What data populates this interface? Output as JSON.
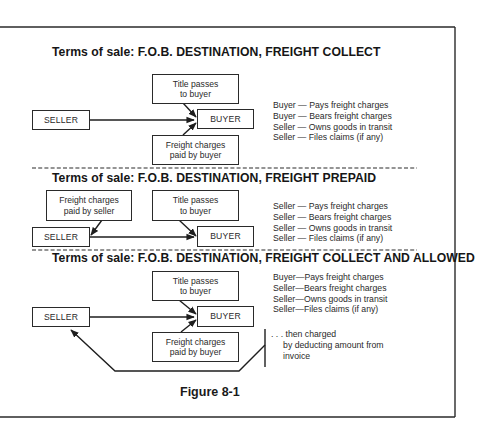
{
  "figure": {
    "caption": "Figure 8-1",
    "sections": [
      {
        "title": "Terms of sale: F.O.B. DESTINATION, FREIGHT COLLECT",
        "boxes": {
          "title_passes": "Title passes\nto buyer",
          "seller": "SELLER",
          "buyer": "BUYER",
          "freight": "Freight charges\npaid by buyer"
        },
        "responsibilities": [
          "Buyer — Pays freight charges",
          "Buyer — Bears freight charges",
          "Seller — Owns goods in transit",
          "Seller — Files claims (if any)"
        ]
      },
      {
        "title": "Terms of sale: F.O.B. DESTINATION, FREIGHT PREPAID",
        "boxes": {
          "freight": "Freight charges\npaid by seller",
          "title_passes": "Title passes\nto buyer",
          "seller": "SELLER",
          "buyer": "BUYER"
        },
        "responsibilities": [
          "Seller — Pays freight charges",
          "Seller — Bears freight charges",
          "Seller — Owns goods in transit",
          "Seller — Files claims (if any)"
        ]
      },
      {
        "title": "Terms of sale: F.O.B. DESTINATION, FREIGHT COLLECT AND ALLOWED",
        "boxes": {
          "title_passes": "Title passes\nto buyer",
          "seller": "SELLER",
          "buyer": "BUYER",
          "freight": "Freight charges\npaid by buyer"
        },
        "responsibilities": [
          "Buyer—Pays freight charges",
          "Seller—Bears freight charges",
          "Seller—Owns goods in transit",
          "Seller—Files claims (if any)"
        ],
        "note": [
          ". . . then charged",
          "     by deducting amount from",
          "     invoice"
        ]
      }
    ]
  }
}
